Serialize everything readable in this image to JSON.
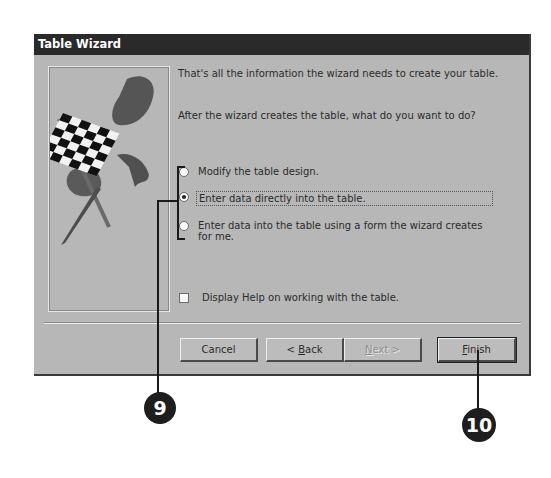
{
  "dialog": {
    "title": "Table Wizard",
    "intro_text": "That's all the information the wizard needs to create your table.",
    "question_text": "After the wizard creates the table, what do you want to do?",
    "options": [
      {
        "label": "Modify the table design.",
        "checked": false
      },
      {
        "label": "Enter data directly into the table.",
        "checked": true
      },
      {
        "label_line1": "Enter data into the table using a form the wizard creates",
        "label_line2": "for me.",
        "checked": false
      }
    ],
    "help_checkbox": {
      "label": "Display Help on working with the table.",
      "checked": false
    },
    "buttons": {
      "cancel": "Cancel",
      "back_prefix": "< ",
      "back_mnemonic": "B",
      "back_rest": "ack",
      "next_mnemonic": "N",
      "next_rest": "ext >",
      "finish_mnemonic": "F",
      "finish_rest": "inish"
    },
    "illustration": "checkered-flag"
  },
  "callouts": [
    {
      "number": "9",
      "target": "option-group"
    },
    {
      "number": "10",
      "target": "finish-button"
    }
  ],
  "colors": {
    "titlebar": "#2a2a2a",
    "dialog_bg": "#b7b7b7",
    "callout_bg": "#1e1e1e"
  }
}
